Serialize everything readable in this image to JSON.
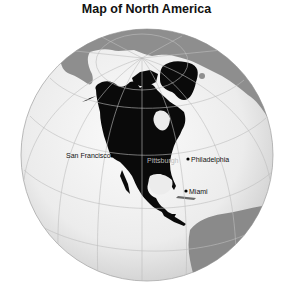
{
  "title": "Map of North America",
  "projection": "orthographic",
  "colors": {
    "background": "#ffffff",
    "ocean": "#ececec",
    "ocean_highlight": "#fafafa",
    "focus_land": "#0a0a0a",
    "other_land": "#8c8c8c",
    "graticule": "#bdbdbd",
    "label_dark": "#111111",
    "label_light": "#bdbdbd"
  },
  "cities": [
    {
      "name": "San Francisco",
      "label_color": "dark"
    },
    {
      "name": "Pittsburgh",
      "label_color": "light"
    },
    {
      "name": "Philadelphia",
      "label_color": "dark"
    },
    {
      "name": "Miami",
      "label_color": "dark"
    }
  ],
  "regions": {
    "highlighted": "North America",
    "context": [
      "Eurasia",
      "South America",
      "Africa"
    ]
  }
}
